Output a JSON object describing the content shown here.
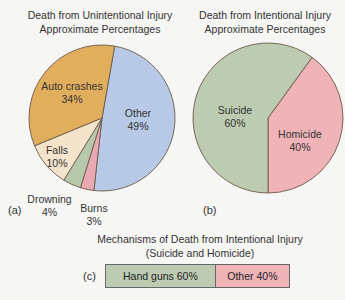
{
  "chart_data": [
    {
      "type": "pie",
      "panel": "(a)",
      "title": "Death from Unintentional Injury",
      "subtitle": "Approximate Percentages",
      "categories": [
        "Other",
        "Burns",
        "Drowning",
        "Falls",
        "Auto crashes"
      ],
      "values": [
        49,
        3,
        4,
        10,
        34
      ],
      "colors": [
        "#b7c9e6",
        "#e9a9b2",
        "#b7c8ad",
        "#f5e4cc",
        "#e1ae5e"
      ]
    },
    {
      "type": "pie",
      "panel": "(b)",
      "title": "Death from Intentional Injury",
      "subtitle": "Approximate Percentages",
      "categories": [
        "Homicide",
        "Suicide"
      ],
      "values": [
        40,
        60
      ],
      "colors": [
        "#efb3b8",
        "#bccbb1"
      ]
    },
    {
      "type": "bar",
      "panel": "(c)",
      "title": "Mechanisms of Death from Intentional Injury",
      "subtitle": "(Suicide and Homicide)",
      "orientation": "horizontal-stacked",
      "categories": [
        "Hand guns",
        "Other"
      ],
      "values": [
        60,
        40
      ],
      "colors": [
        "#bccbb1",
        "#efb3b8"
      ]
    }
  ],
  "labels": {
    "a": {
      "title1": "Death from Unintentional Injury",
      "title2": "Approximate Percentages",
      "panel": "(a)",
      "other": [
        "Other",
        "49%"
      ],
      "auto": [
        "Auto crashes",
        "34%"
      ],
      "falls": [
        "Falls",
        "10%"
      ],
      "drowning": [
        "Drowning",
        "4%"
      ],
      "burns": [
        "Burns",
        "3%"
      ]
    },
    "b": {
      "title1": "Death from Intentional Injury",
      "title2": "Approximate Percentages",
      "panel": "(b)",
      "suicide": [
        "Suicide",
        "60%"
      ],
      "homicide": [
        "Homicide",
        "40%"
      ]
    },
    "c": {
      "title1": "Mechanisms of Death from Intentional Injury",
      "title2": "(Suicide and Homicide)",
      "panel": "(c)",
      "handguns": "Hand guns 60%",
      "other": "Other 40%"
    }
  }
}
